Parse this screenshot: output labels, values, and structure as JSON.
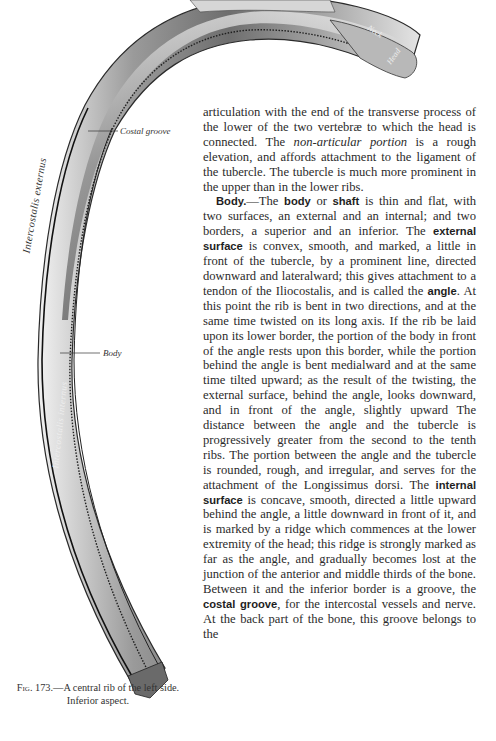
{
  "figure": {
    "number": "Fig. 173.",
    "caption_line1_prefix": "Fig.",
    "caption_line1_rest": "173.—A central rib of the left side.",
    "caption_line2": "Inferior aspect.",
    "labels": {
      "costal_groove": "Costal groove",
      "body": "Body",
      "intercostalis_externus": "Intercostalis externus",
      "intercostalis_internus": "Intercostalis internus",
      "neck": "Neck",
      "head": "Head"
    }
  },
  "text": {
    "p1": {
      "a": "articulation with the end of the transverse process of the lower of the two vertebræ to which the head is connected. The ",
      "italic": "non-articular portion",
      "b": " is a rough elevation, and affords attachment to the ligament of the tubercle. The tubercle is much more prominent in the upper than in the lower ribs."
    },
    "p2": {
      "heading": "Body.",
      "s1": "—The ",
      "bold1": "body",
      "s2": " or ",
      "bold2": "shaft",
      "s3": " is thin and flat, with two surfaces, an external and an internal; and two borders, a superior and an inferior. The ",
      "bold3": "external surface",
      "s4": " is convex, smooth, and marked, a little in front of the tubercle, by a prominent line, directed downward and lateralward; this gives attachment to a tendon of the Iliocostalis, and is called the ",
      "bold4": "angle",
      "s5": ". At this point the rib is bent in two directions, and at the same time twisted on its long axis. If the rib be laid upon its lower border, the portion of the body in front of the angle rests upon this border, while the portion behind the angle is bent medialward and at the same time tilted upward; as the result of the twisting, the external surface, behind the angle, looks downward, and in front of the angle, slightly upward The distance between the angle and the tubercle is progressively greater from the second to the tenth ribs. The portion between the angle and the tubercle is rounded, rough, and irregular, and serves for the attachment of the Longissimus dorsi. The ",
      "bold5": "internal surface",
      "s6": " is concave, smooth, directed a little upward behind the angle, a little downward in front of it, and is marked by a ridge which commences at the lower extremity of the head; this ridge is strongly marked as far as the angle, and gradually becomes lost at the junction of the anterior and middle thirds of the bone. Between it and the inferior border is a groove, the ",
      "bold6": "costal groove",
      "s7": ", for the intercostal vessels and nerve. At the back part of the bone, this groove belongs to the"
    }
  }
}
